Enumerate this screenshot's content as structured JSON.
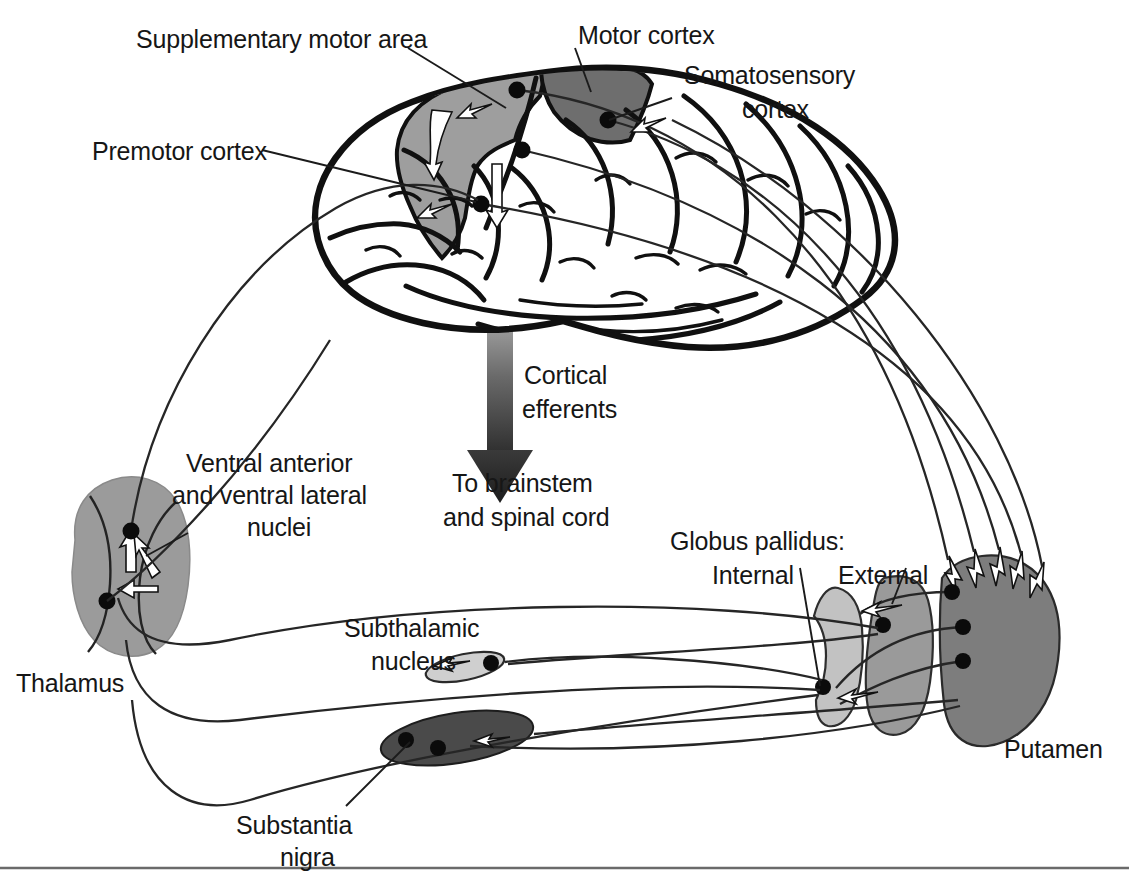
{
  "figure": {
    "background_color": "#ffffff",
    "width": 1129,
    "height": 880
  },
  "labels": {
    "supplementary_motor_area": "Supplementary motor area",
    "motor_cortex": "Motor cortex",
    "somatosensory_cortex_line1": "Somatosensory",
    "somatosensory_cortex_line2": "cortex",
    "premotor_cortex": "Premotor cortex",
    "cortical_efferents_line1": "Cortical",
    "cortical_efferents_line2": "efferents",
    "to_brainstem_line1": "To brainstem",
    "to_brainstem_line2": "and spinal cord",
    "ventral_nuclei_line1": "Ventral anterior",
    "ventral_nuclei_line2": "and ventral lateral",
    "ventral_nuclei_line3": "nuclei",
    "thalamus": "Thalamus",
    "subthalamic_nucleus_line1": "Subthalamic",
    "subthalamic_nucleus_line2": "nucleus",
    "globus_pallidus_heading": "Globus pallidus:",
    "globus_pallidus_internal": "Internal",
    "globus_pallidus_external": "External",
    "putamen": "Putamen",
    "substantia_nigra_line1": "Substantia",
    "substantia_nigra_line2": "nigra"
  },
  "structures": [
    {
      "name": "supplementary-motor-area",
      "label": "Supplementary motor area",
      "fill": "#9e9e9e"
    },
    {
      "name": "motor-cortex",
      "label": "Motor cortex",
      "fill": "#6e6e6e"
    },
    {
      "name": "somatosensory-cortex",
      "label": "Somatosensory cortex",
      "fill": "#ffffff"
    },
    {
      "name": "premotor-cortex",
      "label": "Premotor cortex",
      "fill": "#ffffff"
    },
    {
      "name": "thalamus",
      "label": "Thalamus",
      "fill": "#9b9b9b"
    },
    {
      "name": "subthalamic-nucleus",
      "label": "Subthalamic nucleus",
      "fill": "#cfcfcf"
    },
    {
      "name": "substantia-nigra",
      "label": "Substantia nigra",
      "fill": "#4a4a4a"
    },
    {
      "name": "globus-pallidus-internal",
      "label": "Internal",
      "fill": "#c2c2c2"
    },
    {
      "name": "globus-pallidus-external",
      "label": "External",
      "fill": "#9a9a9a"
    },
    {
      "name": "putamen",
      "label": "Putamen",
      "fill": "#7d7d7d"
    }
  ],
  "colors": {
    "ink": "#161616",
    "outline": "#101010",
    "sma_gray": "#9e9e9e",
    "motor_gray": "#6e6e6e",
    "thalamus_gray": "#9b9b9b",
    "stn_gray": "#cfcfcf",
    "snc_gray": "#4a4a4a",
    "gpi_gray": "#c2c2c2",
    "gpe_gray": "#9a9a9a",
    "putamen_gray": "#7d7d7d",
    "rule_gray": "#6a6a6a"
  },
  "annotations": {
    "cortical_efferent_arrow": "downward gradient arrow from cortex to brainstem",
    "cortex_to_putamen_projection_count": 5,
    "putamen_to_pallidum_projection_count": 3,
    "pallidum_to_thalamus_projection_count": 2
  }
}
